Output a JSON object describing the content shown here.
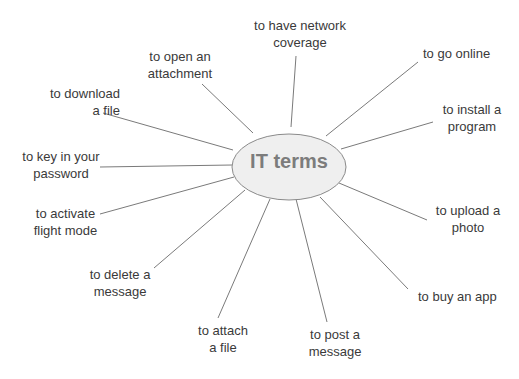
{
  "diagram": {
    "center": "IT terms",
    "colors": {
      "line": "#7a7a7a",
      "ellipse_fill": "#efefef",
      "ellipse_stroke": "#8a8a8a",
      "text": "#3a3a3a",
      "center_text": "#7c7c7c"
    },
    "branches": [
      {
        "label": "to have network\ncoverage"
      },
      {
        "label": "to go online"
      },
      {
        "label": "to install a\nprogram"
      },
      {
        "label": "to upload a\nphoto"
      },
      {
        "label": "to buy an app"
      },
      {
        "label": "to post a\nmessage"
      },
      {
        "label": "to attach\na file"
      },
      {
        "label": "to delete a\nmessage"
      },
      {
        "label": "to activate\nflight mode"
      },
      {
        "label": "to key in your\npassword"
      },
      {
        "label": "to download\na file"
      },
      {
        "label": "to open an\nattachment"
      }
    ]
  }
}
